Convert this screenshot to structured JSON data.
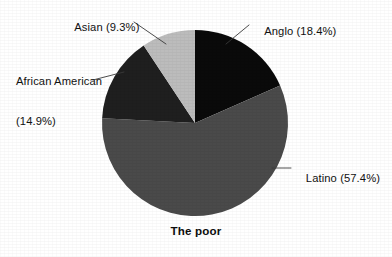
{
  "chart_data": {
    "type": "pie",
    "title": "The poor",
    "xlabel": "",
    "ylabel": "",
    "legend_position": "callout-labels",
    "grid": false,
    "categories": [
      "Anglo",
      "Latino",
      "African American",
      "Asian"
    ],
    "values": [
      18.4,
      57.4,
      14.9,
      9.3
    ],
    "units": "percent",
    "start_angle_deg": 0,
    "direction": "clockwise",
    "slices": [
      {
        "name": "Anglo",
        "value": 18.4,
        "label": "Anglo (18.4%)",
        "color": "#0a0a0a",
        "start_deg": 0,
        "end_deg": 66.24
      },
      {
        "name": "Latino",
        "value": 57.4,
        "label": "Latino (57.4%)",
        "color": "#4a4a4a",
        "start_deg": 66.24,
        "end_deg": 272.88
      },
      {
        "name": "African American",
        "value": 14.9,
        "label_line1": "African American",
        "label_line2": "(14.9%)",
        "label": "African American (14.9%)",
        "color": "#1f1f1f",
        "start_deg": 272.88,
        "end_deg": 326.52
      },
      {
        "name": "Asian",
        "value": 9.3,
        "label": "Asian (9.3%)",
        "color": "#bcbcbc",
        "start_deg": 326.52,
        "end_deg": 360
      }
    ]
  },
  "callouts": {
    "asian": "Asian (9.3%)",
    "anglo": "Anglo (18.4%)",
    "african_american_line1": "African American",
    "african_american_line2": "(14.9%)",
    "latino": "Latino (57.4%)"
  },
  "caption": {
    "text": "The poor"
  },
  "colors": {
    "background": "#ffffff",
    "text": "#111111",
    "leader_line": "#3a3a3a",
    "anglo": "#0a0a0a",
    "latino": "#4a4a4a",
    "african_american": "#1f1f1f",
    "asian": "#bcbcbc"
  }
}
